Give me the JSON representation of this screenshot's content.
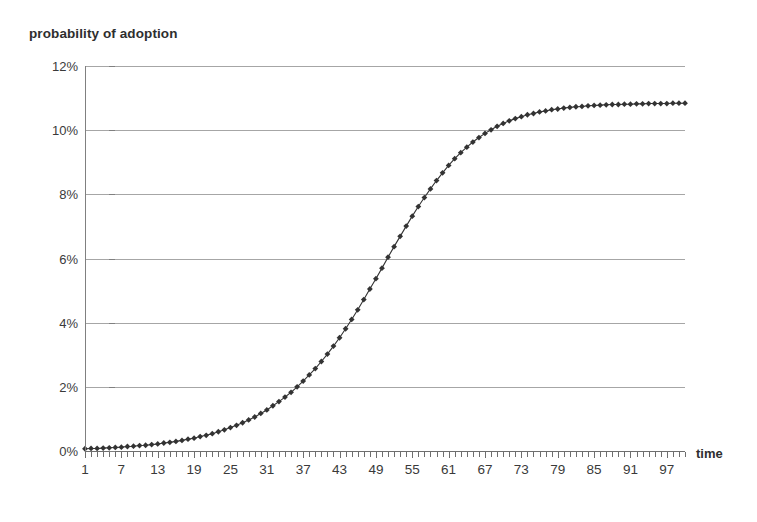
{
  "chart_data": {
    "type": "line",
    "title": "probability of adoption",
    "xlabel": "time",
    "ylabel": "probability of adoption",
    "xlim": [
      1,
      100
    ],
    "ylim": [
      0,
      12
    ],
    "ytick_labels": [
      "0%",
      "2%",
      "4%",
      "6%",
      "8%",
      "10%",
      "12%"
    ],
    "ytick_values": [
      0,
      2,
      4,
      6,
      8,
      10,
      12
    ],
    "xtick_labels": [
      "1",
      "7",
      "13",
      "19",
      "25",
      "31",
      "37",
      "43",
      "49",
      "55",
      "61",
      "67",
      "73",
      "79",
      "85",
      "91",
      "97"
    ],
    "xtick_values": [
      1,
      7,
      13,
      19,
      25,
      31,
      37,
      43,
      49,
      55,
      61,
      67,
      73,
      79,
      85,
      91,
      97
    ],
    "minor_xticks": "every 1 unit from 1 to 100",
    "grid": "horizontal only",
    "legend": "none",
    "marker": "diamond",
    "marker_color": "#333333",
    "line_color": "#333333",
    "gridline_color": "#a6a6a6",
    "axis_color": "#6e6e6e",
    "series": [
      {
        "name": "probability of adoption",
        "model": "logistic",
        "L": 10,
        "k": 0.1,
        "t0": 50,
        "x": [
          1,
          2,
          3,
          4,
          5,
          6,
          7,
          8,
          9,
          10,
          11,
          12,
          13,
          14,
          15,
          16,
          17,
          18,
          19,
          20,
          21,
          22,
          23,
          24,
          25,
          26,
          27,
          28,
          29,
          30,
          31,
          32,
          33,
          34,
          35,
          36,
          37,
          38,
          39,
          40,
          41,
          42,
          43,
          44,
          45,
          46,
          47,
          48,
          49,
          50,
          51,
          52,
          53,
          54,
          55,
          56,
          57,
          58,
          59,
          60,
          61,
          62,
          63,
          64,
          65,
          66,
          67,
          68,
          69,
          70,
          71,
          72,
          73,
          74,
          75,
          76,
          77,
          78,
          79,
          80,
          81,
          82,
          83,
          84,
          85,
          86,
          87,
          88,
          89,
          90,
          91,
          92,
          93,
          94,
          95,
          96,
          97,
          98,
          99,
          100
        ],
        "values": [
          0.07,
          0.08,
          0.08,
          0.09,
          0.1,
          0.11,
          0.12,
          0.14,
          0.15,
          0.17,
          0.18,
          0.2,
          0.22,
          0.25,
          0.27,
          0.3,
          0.33,
          0.37,
          0.4,
          0.45,
          0.49,
          0.54,
          0.6,
          0.66,
          0.73,
          0.8,
          0.88,
          0.97,
          1.06,
          1.17,
          1.28,
          1.41,
          1.54,
          1.68,
          1.83,
          2.0,
          2.18,
          2.37,
          2.57,
          2.79,
          3.02,
          3.27,
          3.53,
          3.81,
          4.1,
          4.4,
          4.72,
          5.05,
          5.37,
          5.7,
          6.04,
          6.37,
          6.69,
          7.01,
          7.32,
          7.62,
          7.9,
          8.17,
          8.43,
          8.67,
          8.9,
          9.11,
          9.3,
          9.47,
          9.63,
          9.77,
          9.9,
          10.01,
          10.12,
          10.21,
          10.29,
          10.36,
          10.42,
          10.48,
          10.52,
          10.57,
          10.6,
          10.64,
          10.66,
          10.69,
          10.71,
          10.73,
          10.74,
          10.76,
          10.77,
          10.78,
          10.79,
          10.8,
          10.8,
          10.81,
          10.81,
          10.82,
          10.82,
          10.83,
          10.83,
          10.83,
          10.83,
          10.84,
          10.84,
          10.84
        ]
      }
    ],
    "annotations": []
  }
}
